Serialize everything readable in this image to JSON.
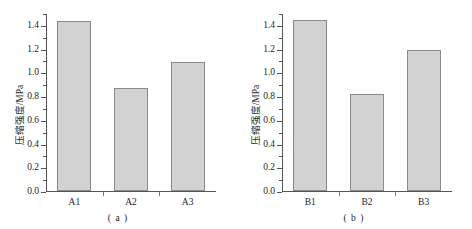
{
  "chart_data": [
    {
      "type": "bar",
      "panel_label": "( a )",
      "categories": [
        "A1",
        "A2",
        "A3"
      ],
      "values": [
        1.43,
        0.87,
        1.09
      ],
      "title": "",
      "xlabel": "",
      "ylabel": "压缩强度/MPa",
      "ylim": [
        0.0,
        1.5
      ],
      "yticks": [
        0.0,
        0.2,
        0.4,
        0.6,
        0.8,
        1.0,
        1.2,
        1.4
      ],
      "ytick_labels": [
        "0.0",
        "0.2",
        "0.4",
        "0.6",
        "0.8",
        "1.0",
        "1.2",
        "1.4"
      ],
      "minor_tick_step": 0.1,
      "grid": false,
      "legend": null,
      "bar_color": "#d2d2d2",
      "bar_edge_color": "#8a8a8a"
    },
    {
      "type": "bar",
      "panel_label": "( b )",
      "categories": [
        "B1",
        "B2",
        "B3"
      ],
      "values": [
        1.44,
        0.82,
        1.19
      ],
      "title": "",
      "xlabel": "",
      "ylabel": "压缩强度/MPa",
      "ylim": [
        0.0,
        1.5
      ],
      "yticks": [
        0.0,
        0.2,
        0.4,
        0.6,
        0.8,
        1.0,
        1.2,
        1.4
      ],
      "ytick_labels": [
        "0.0",
        "0.2",
        "0.4",
        "0.6",
        "0.8",
        "1.0",
        "1.2",
        "1.4"
      ],
      "minor_tick_step": 0.1,
      "grid": false,
      "legend": null,
      "bar_color": "#d2d2d2",
      "bar_edge_color": "#8a8a8a"
    }
  ]
}
